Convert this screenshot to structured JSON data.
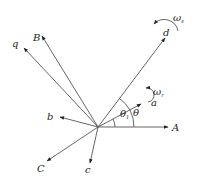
{
  "diagram": {
    "type": "vector-phasor-diagram",
    "origin": {
      "x": 98,
      "y": 127
    },
    "axes": [
      {
        "label": "A",
        "x2": 168,
        "y2": 127
      },
      {
        "label": "B",
        "x2": 42,
        "y2": 35
      },
      {
        "label": "C",
        "x2": 47,
        "y2": 161
      },
      {
        "label": "a",
        "x2": 141,
        "y2": 103
      },
      {
        "label": "b",
        "x2": 60,
        "y2": 116
      },
      {
        "label": "c",
        "x2": 90,
        "y2": 163
      },
      {
        "label": "d",
        "x2": 165,
        "y2": 37
      },
      {
        "label": "q",
        "x2": 24,
        "y2": 48
      }
    ],
    "labels": {
      "A": "A",
      "B": "B",
      "C": "C",
      "a": "a",
      "b": "b",
      "c": "c",
      "d": "d",
      "q": "q",
      "omega": "ω",
      "omega_s_sub": "s",
      "omega_r_sub": "r",
      "theta": "θ",
      "theta_1": "θ",
      "theta_1_sub": "1"
    }
  }
}
